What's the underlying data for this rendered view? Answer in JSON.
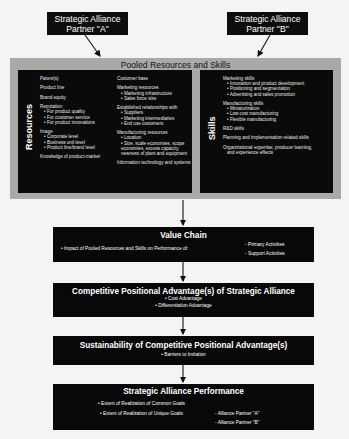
{
  "partners": [
    {
      "line1": "Strategic Alliance",
      "line2": "Partner \"A\""
    },
    {
      "line1": "Strategic Alliance",
      "line2": "Partner \"B\""
    }
  ],
  "pooled": {
    "title": "Pooled Resources and Skills",
    "resources": {
      "label": "Resources",
      "col1": [
        {
          "head": "Patent(s)",
          "subs": []
        },
        {
          "head": "Product line",
          "subs": []
        },
        {
          "head": "Brand equity",
          "subs": []
        },
        {
          "head": "Reputation",
          "subs": [
            "• For product quality",
            "• For customer service",
            "• For product innovations"
          ]
        },
        {
          "head": "Image",
          "subs": [
            "• Corporate level",
            "• Business unit level",
            "• Product line/brand level"
          ]
        },
        {
          "head": "Knowledge of product-market",
          "subs": []
        }
      ],
      "col2": [
        {
          "head": "Customer base",
          "subs": []
        },
        {
          "head": "Marketing resources",
          "subs": [
            "• Marketing infrastructure",
            "• Sales force size"
          ]
        },
        {
          "head": "Established relationships with",
          "subs": [
            "• Suppliers",
            "• Marketing intermediaries",
            "• End use customers"
          ]
        },
        {
          "head": "Manufacturing resources",
          "subs": [
            "• Location",
            "• Size, scale economies, scope",
            "  economies, excess capacity,",
            "  newness of plant and equipment"
          ]
        },
        {
          "head": "Information technology and systems",
          "subs": []
        }
      ]
    },
    "skills": {
      "label": "Skills",
      "items": [
        {
          "head": "Marketing skills",
          "subs": [
            "• Innovation and product development",
            "• Positioning and segmentation",
            "• Advertising and sales promotion"
          ]
        },
        {
          "head": "Manufacturing skills",
          "subs": [
            "• Miniaturization",
            "• Low cost manufacturing",
            "• Flexible manufacturing"
          ]
        },
        {
          "head": "R&D skills",
          "subs": []
        },
        {
          "head": "Planning and implementation related skills",
          "subs": []
        },
        {
          "head": "Organizational expertise, producer learning,",
          "subs": [
            "and experience effects"
          ]
        }
      ]
    }
  },
  "value_chain": {
    "title": "Value Chain",
    "impact": "• Impact of Pooled Resources and Skills on Performance of:",
    "primary": "- Primary Activities",
    "support": "- Support Activities"
  },
  "competitive": {
    "title": "Competitive Positional Advantage(s) of Strategic Alliance",
    "items": [
      "• Cost Advantage",
      "• Differentiation Advantage"
    ]
  },
  "sustainability": {
    "title": "Sustainability of Competitive Positional Advantage(s)",
    "items": [
      "• Barriers to Imitation"
    ]
  },
  "performance": {
    "title": "Strategic Alliance Performance",
    "common": "• Extent of Realization of Common Goals",
    "unique": "• Extent of Realization of Unique Goals:",
    "partner_a": "- Alliance Partner \"A\"",
    "partner_b": "- Alliance Partner \"B\""
  }
}
